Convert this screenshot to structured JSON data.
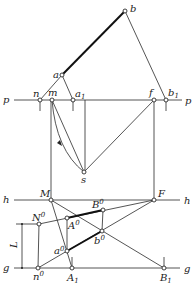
{
  "figure": {
    "lines": {
      "p_left": "p",
      "p_right": "p",
      "h_left": "h",
      "h_right": "h",
      "g_left": "g",
      "g_right": "g"
    },
    "points": {
      "b": "b",
      "a": "a",
      "n": "n",
      "m": "m",
      "a1": "a",
      "a1_sub": "1",
      "f": "f",
      "b1": "b",
      "b1_sub": "1",
      "s": "s",
      "M": "M",
      "F": "F",
      "N0": "N",
      "N0_sup": "0",
      "A0": "A",
      "A0_sup": "0",
      "B0": "B",
      "B0_sup": "0",
      "a0": "a",
      "a0_sup": "0",
      "b0": "b",
      "b0_sup": "0",
      "n0": "n",
      "n0_sup": "0",
      "A1": "A",
      "A1_sub": "1",
      "B1": "B",
      "B1_sub": "1"
    },
    "dimension": {
      "label": "L"
    }
  }
}
